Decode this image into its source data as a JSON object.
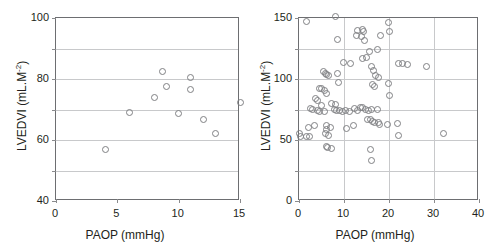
{
  "figure": {
    "panel_count": 2
  },
  "chart_data": [
    {
      "type": "scatter",
      "panel": "left",
      "title": "",
      "xlabel": "PAOP (mmHg)",
      "ylabel_main": "LVEDVI (mL.M",
      "ylabel_sup": "-2",
      "ylabel_tail": ")",
      "ylabel": "LVEDVI (mL.M-2)",
      "xlim": [
        0,
        15
      ],
      "ylim": [
        40,
        100
      ],
      "xticks": [
        0,
        5,
        10,
        15
      ],
      "xtick_labels": [
        "0",
        "5",
        "10",
        "15"
      ],
      "yticks": [
        40,
        50,
        60,
        70,
        80,
        90,
        100
      ],
      "ytick_labels": [
        "40",
        "",
        "60",
        "",
        "80",
        "",
        "100"
      ],
      "ytick_labels_shown": [
        "40",
        "60",
        "80",
        "100"
      ],
      "grid": true,
      "grid_axis": "y",
      "marker": "open-circle",
      "marker_color": "#808184",
      "n_points": 12,
      "points": [
        {
          "x": 4.0,
          "y": 57.0
        },
        {
          "x": 6.0,
          "y": 69.0
        },
        {
          "x": 8.0,
          "y": 73.8
        },
        {
          "x": 8.7,
          "y": 82.4
        },
        {
          "x": 9.0,
          "y": 77.4
        },
        {
          "x": 10.0,
          "y": 68.8
        },
        {
          "x": 11.0,
          "y": 80.4
        },
        {
          "x": 11.0,
          "y": 76.6
        },
        {
          "x": 12.0,
          "y": 66.8
        },
        {
          "x": 13.0,
          "y": 62.2
        },
        {
          "x": 15.0,
          "y": 72.4
        }
      ]
    },
    {
      "type": "scatter",
      "panel": "right",
      "title": "",
      "xlabel": "PAOP (mmHg)",
      "ylabel_main": "LVEDVI (mL.M",
      "ylabel_sup": "-2",
      "ylabel_tail": ")",
      "ylabel": "LVEDVI (mL.M-2)",
      "xlim": [
        0,
        40
      ],
      "ylim": [
        0,
        150
      ],
      "xticks": [
        0,
        10,
        20,
        30,
        40
      ],
      "xtick_labels": [
        "0",
        "10",
        "20",
        "30",
        "40"
      ],
      "yticks": [
        0,
        25,
        50,
        75,
        100,
        125,
        150
      ],
      "ytick_labels_shown": [
        "0",
        "50",
        "100",
        "150"
      ],
      "grid": true,
      "grid_axis": "both",
      "marker": "open-circle",
      "marker_color": "#808184",
      "n_points": 92,
      "points": [
        {
          "x": 1.6,
          "y": 147.0
        },
        {
          "x": 8.2,
          "y": 151.0
        },
        {
          "x": 19.8,
          "y": 146.0
        },
        {
          "x": 13.0,
          "y": 140.0
        },
        {
          "x": 14.0,
          "y": 140.5
        },
        {
          "x": 14.3,
          "y": 139.0
        },
        {
          "x": 12.8,
          "y": 136.0
        },
        {
          "x": 13.8,
          "y": 135.0
        },
        {
          "x": 14.6,
          "y": 131.5
        },
        {
          "x": 18.0,
          "y": 135.5
        },
        {
          "x": 8.5,
          "y": 132.0
        },
        {
          "x": 17.5,
          "y": 124.0
        },
        {
          "x": 15.6,
          "y": 122.5
        },
        {
          "x": 11.5,
          "y": 113.0
        },
        {
          "x": 14.0,
          "y": 116.5
        },
        {
          "x": 22.0,
          "y": 113.0
        },
        {
          "x": 23.0,
          "y": 112.5
        },
        {
          "x": 24.2,
          "y": 112.0
        },
        {
          "x": 28.3,
          "y": 110.0
        },
        {
          "x": 16.5,
          "y": 107.0
        },
        {
          "x": 5.4,
          "y": 106.0
        },
        {
          "x": 5.9,
          "y": 104.5
        },
        {
          "x": 6.2,
          "y": 104.0
        },
        {
          "x": 6.5,
          "y": 103.0
        },
        {
          "x": 8.6,
          "y": 104.5
        },
        {
          "x": 17.0,
          "y": 103.0
        },
        {
          "x": 17.6,
          "y": 101.5
        },
        {
          "x": 8.8,
          "y": 97.0
        },
        {
          "x": 16.4,
          "y": 95.5
        },
        {
          "x": 16.8,
          "y": 94.0
        },
        {
          "x": 19.8,
          "y": 96.0
        },
        {
          "x": 4.5,
          "y": 92.5
        },
        {
          "x": 5.1,
          "y": 92.0
        },
        {
          "x": 5.6,
          "y": 90.5
        },
        {
          "x": 6.1,
          "y": 88.0
        },
        {
          "x": 20.0,
          "y": 86.5
        },
        {
          "x": 3.6,
          "y": 84.0
        },
        {
          "x": 4.2,
          "y": 82.0
        },
        {
          "x": 7.2,
          "y": 80.0
        },
        {
          "x": 2.5,
          "y": 76.0
        },
        {
          "x": 3.1,
          "y": 75.0
        },
        {
          "x": 4.0,
          "y": 74.0
        },
        {
          "x": 4.6,
          "y": 73.0
        },
        {
          "x": 5.6,
          "y": 73.5
        },
        {
          "x": 7.8,
          "y": 75.0
        },
        {
          "x": 8.4,
          "y": 74.5
        },
        {
          "x": 9.0,
          "y": 74.0
        },
        {
          "x": 9.6,
          "y": 73.5
        },
        {
          "x": 10.4,
          "y": 74.0
        },
        {
          "x": 11.2,
          "y": 73.5
        },
        {
          "x": 12.4,
          "y": 75.5
        },
        {
          "x": 13.0,
          "y": 74.5
        },
        {
          "x": 13.6,
          "y": 76.5
        },
        {
          "x": 14.2,
          "y": 77.0
        },
        {
          "x": 14.8,
          "y": 75.0
        },
        {
          "x": 15.4,
          "y": 74.0
        },
        {
          "x": 16.2,
          "y": 75.0
        },
        {
          "x": 17.4,
          "y": 75.0
        },
        {
          "x": 15.2,
          "y": 67.0
        },
        {
          "x": 15.9,
          "y": 66.5
        },
        {
          "x": 16.4,
          "y": 65.0
        },
        {
          "x": 16.8,
          "y": 64.5
        },
        {
          "x": 17.6,
          "y": 64.0
        },
        {
          "x": 17.9,
          "y": 62.5
        },
        {
          "x": 21.8,
          "y": 63.5
        },
        {
          "x": 2.0,
          "y": 60.0
        },
        {
          "x": 3.4,
          "y": 62.0
        },
        {
          "x": 6.2,
          "y": 62.0
        },
        {
          "x": 6.0,
          "y": 58.5
        },
        {
          "x": 7.0,
          "y": 60.0
        },
        {
          "x": 10.5,
          "y": 59.5
        },
        {
          "x": 0.2,
          "y": 55.0
        },
        {
          "x": 0.3,
          "y": 52.5
        },
        {
          "x": 1.6,
          "y": 53.0
        },
        {
          "x": 2.3,
          "y": 52.5
        },
        {
          "x": 5.9,
          "y": 55.0
        },
        {
          "x": 6.6,
          "y": 54.0
        },
        {
          "x": 22.0,
          "y": 54.0
        },
        {
          "x": 32.2,
          "y": 55.0
        },
        {
          "x": 6.0,
          "y": 45.0
        },
        {
          "x": 6.4,
          "y": 43.5
        },
        {
          "x": 7.2,
          "y": 43.0
        },
        {
          "x": 15.8,
          "y": 42.5
        },
        {
          "x": 16.0,
          "y": 33.5
        },
        {
          "x": 5.0,
          "y": 78.0
        },
        {
          "x": 8.1,
          "y": 79.0
        },
        {
          "x": 12.0,
          "y": 62.0
        },
        {
          "x": 19.6,
          "y": 63.0
        },
        {
          "x": 15.0,
          "y": 118.0
        },
        {
          "x": 9.9,
          "y": 113.5
        },
        {
          "x": 16.0,
          "y": 110.0
        },
        {
          "x": 20.2,
          "y": 139.0
        }
      ]
    }
  ]
}
